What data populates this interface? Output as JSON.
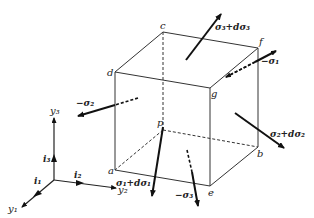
{
  "diagram": {
    "type": "stress-element-cube",
    "vertices": {
      "a": "a",
      "b": "b",
      "c": "c",
      "d": "d",
      "e": "e",
      "f": "f",
      "g": "g",
      "p": "p"
    },
    "stress_labels": {
      "sigma3_plus": "σ₃+dσ₃",
      "neg_sigma1": "−σ₁",
      "neg_sigma2": "−σ₂",
      "sigma2_plus": "σ₂+dσ₂",
      "sigma1_plus": "σ₁+dσ₁",
      "neg_sigma3": "−σ₃"
    },
    "axes": {
      "y1": "y₁",
      "y2": "y₂",
      "y3": "y₃",
      "i1": "i₁",
      "i2": "i₂",
      "i3": "i₃"
    }
  }
}
